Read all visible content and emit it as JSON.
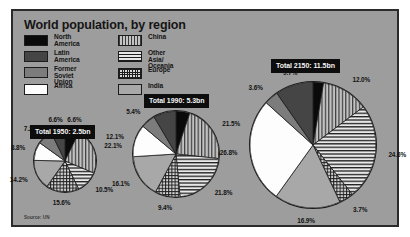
{
  "figure": {
    "title": "World population, by region",
    "source": "Source: UN",
    "background_color": "#9d9d9d",
    "frame_color": "#2b2b2b"
  },
  "legend": {
    "items": [
      {
        "key": "north-america",
        "label": "North America",
        "swatch": "solid-black",
        "color": "#0a0a0a"
      },
      {
        "key": "latin-america",
        "label": "Latin America",
        "swatch": "solid-dark-gray",
        "color": "#454545"
      },
      {
        "key": "former-soviet-union",
        "label": "Former\nSoviet Union",
        "swatch": "solid-mid-gray",
        "color": "#7c7c7c"
      },
      {
        "key": "africa",
        "label": "Africa",
        "swatch": "solid-white",
        "color": "#fdfdfd"
      },
      {
        "key": "china",
        "label": "China",
        "swatch": "vertical-stripes",
        "color": "#c4c4c4"
      },
      {
        "key": "other-asia",
        "label": "Other Asia/\nOceania",
        "swatch": "horizontal-stripes",
        "color": "#e8e8e8"
      },
      {
        "key": "europe",
        "label": "Europe",
        "swatch": "crosshatch-grid",
        "color": "#d8d8d8"
      },
      {
        "key": "india",
        "label": "India",
        "swatch": "solid-light-gray",
        "color": "#a8a8a8"
      }
    ]
  },
  "chart_data": {
    "type": "pie",
    "title": "World population, by region",
    "source": "Source: UN",
    "categories": [
      "North America",
      "China",
      "Other Asia/Oceania",
      "Europe",
      "India",
      "Africa",
      "Former Soviet Union",
      "Latin America"
    ],
    "series": [
      {
        "name": "1950",
        "label": "Total 1950: 2.5bn",
        "total": "2.5bn",
        "values": [
          6.6,
          22.1,
          10.5,
          15.6,
          14.2,
          8.8,
          7.2,
          6.6
        ],
        "labels": [
          "6.6%",
          "22.1%",
          "10.5%",
          "15.6%",
          "14.2%",
          "8.8%",
          "7.2%",
          "6.6%"
        ]
      },
      {
        "name": "1990",
        "label": "Total 1990: 5.3bn",
        "total": "5.3bn",
        "values": [
          5.2,
          21.5,
          21.8,
          9.4,
          16.1,
          12.1,
          5.4,
          8.5
        ],
        "labels": [
          "5.2%",
          "21.5%",
          "21.8%",
          "9.4%",
          "16.1%",
          "12.1%",
          "5.4%",
          "8.5%"
        ]
      },
      {
        "name": "2150",
        "label": "Total 2150: 11.5bn",
        "total": "11.5bn",
        "values": [
          2.7,
          12.0,
          24.6,
          3.7,
          16.9,
          26.8,
          3.6,
          9.7
        ],
        "labels": [
          "2.7%",
          "12.0%",
          "24.6%",
          "3.7%",
          "16.9%",
          "26.8%",
          "3.6%",
          "9.7%"
        ]
      }
    ],
    "legend_position": "top-left",
    "grid": false
  }
}
